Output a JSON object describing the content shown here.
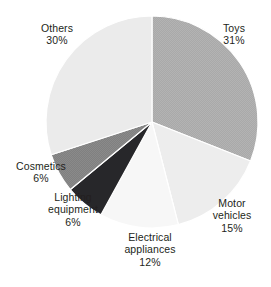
{
  "chart_data": {
    "type": "pie",
    "title": "",
    "subtitle": "",
    "xlabel": "",
    "ylabel": "",
    "legend_position": "none",
    "grid": false,
    "start_angle_deg": 0,
    "direction": "clockwise",
    "categories": [
      "Toys",
      "Motor vehicles",
      "Electrical appliances",
      "Lighting equipment",
      "Cosmetics",
      "Others"
    ],
    "values": [
      31,
      15,
      12,
      6,
      6,
      30
    ],
    "value_suffix": "%",
    "slices": [
      {
        "label": "Toys",
        "value": 31,
        "value_text": "31%",
        "color": "#a9a9a9",
        "label_lines": [
          "Toys",
          "31%"
        ]
      },
      {
        "label": "Motor vehicles",
        "value": 15,
        "value_text": "15%",
        "color": "#ededed",
        "label_lines": [
          "Motor",
          "vehicles",
          "15%"
        ]
      },
      {
        "label": "Electrical appliances",
        "value": 12,
        "value_text": "12%",
        "color": "#f7f7f7",
        "label_lines": [
          "Electrical",
          "appliances",
          "12%"
        ]
      },
      {
        "label": "Lighting equipment",
        "value": 6,
        "value_text": "6%",
        "color": "#27272a",
        "label_lines": [
          "Lighting",
          "equipment",
          "6%"
        ]
      },
      {
        "label": "Cosmetics",
        "value": 6,
        "value_text": "6%",
        "color": "#808080",
        "label_lines": [
          "Cosmetics",
          "6%"
        ]
      },
      {
        "label": "Others",
        "value": 30,
        "value_text": "30%",
        "color": "#ebebeb",
        "label_lines": [
          "Others",
          "30%"
        ]
      }
    ]
  },
  "labels": {
    "others": {
      "name": "Others",
      "pct": "30%"
    },
    "toys": {
      "name": "Toys",
      "pct": "31%"
    },
    "motor": {
      "line1": "Motor",
      "line2": "vehicles",
      "pct": "15%"
    },
    "electrical": {
      "line1": "Electrical",
      "line2": "appliances",
      "pct": "12%"
    },
    "lighting": {
      "line1": "Lighting",
      "line2": "equipment",
      "pct": "6%"
    },
    "cosmetics": {
      "name": "Cosmetics",
      "pct": "6%"
    }
  },
  "geometry": {
    "center_x": 152,
    "center_y": 122,
    "radius": 106
  },
  "colors": {
    "background": "#ffffff",
    "text": "#231f20",
    "slice_border": "#ffffff"
  }
}
